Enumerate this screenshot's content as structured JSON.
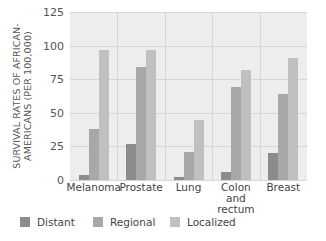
{
  "chart_data": {
    "type": "bar",
    "title": "",
    "xlabel": "",
    "ylabel": "SURVIVAL RATES OF AFRICAN-AMERICANS (PER 100,000)",
    "ylabel_lines": [
      "SURVIVAL RATES OF AFRICAN-",
      "AMERICANS (PER 100,000)"
    ],
    "ylim": [
      0,
      125
    ],
    "yticks": [
      0,
      25,
      50,
      75,
      100,
      125
    ],
    "grid": true,
    "legend_position": "bottom",
    "categories": [
      "Melanoma",
      "Prostate",
      "Lung",
      "Colon and rectum",
      "Breast"
    ],
    "category_labels": [
      [
        "Melanoma"
      ],
      [
        "Prostate"
      ],
      [
        "Lung"
      ],
      [
        "Colon",
        "and rectum"
      ],
      [
        "Breast"
      ]
    ],
    "series": [
      {
        "name": "Distant",
        "color": "#8c8c8c",
        "values": [
          4,
          27,
          2,
          6,
          20
        ]
      },
      {
        "name": "Regional",
        "color": "#a8a8a8",
        "values": [
          38,
          84,
          21,
          69,
          64
        ]
      },
      {
        "name": "Localized",
        "color": "#c0c0c0",
        "values": [
          97,
          97,
          45,
          82,
          91
        ]
      }
    ]
  },
  "colors": {
    "plot_background": "#ededed",
    "gridline": "#d6d6d6"
  }
}
